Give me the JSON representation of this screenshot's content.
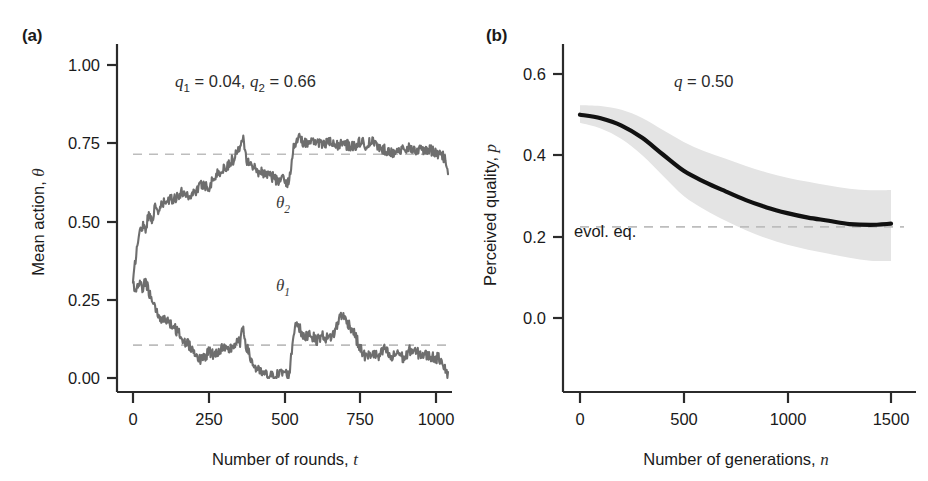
{
  "figure": {
    "background": "#ffffff",
    "panels": [
      "a",
      "b"
    ]
  },
  "panel_a": {
    "label": "(a)",
    "annotation": {
      "q1_sym": "q",
      "q1_sub": "1",
      "q1_eq": " = 0.04, ",
      "q2_sym": "q",
      "q2_sub": "2",
      "q2_eq": " = 0.66",
      "full": "q1 = 0.04, q2 = 0.66"
    },
    "curve_labels": {
      "upper_sym": "θ",
      "upper_sub": "2",
      "lower_sym": "θ",
      "lower_sub": "1"
    },
    "ylabel_text": "Mean action, ",
    "ylabel_sym": "θ",
    "xlabel_text": "Number of rounds, ",
    "xlabel_sym": "t",
    "yticks": [
      "0.00",
      "0.25",
      "0.50",
      "0.75",
      "1.00"
    ],
    "xticks": [
      "0",
      "250",
      "500",
      "750",
      "1000"
    ],
    "line_color": "#6e6e6e",
    "dash_color": "#b9b9b9"
  },
  "panel_b": {
    "label": "(b)",
    "annotation": {
      "q_sym": "q",
      "q_eq": " = 0.50",
      "full": "q = 0.50"
    },
    "evol_label": "evol. eq.",
    "ylabel_text": "Perceived quality, ",
    "ylabel_sym": "p",
    "xlabel_text": "Number of generations, ",
    "xlabel_sym": "n",
    "yticks": [
      "0.0",
      "0.2",
      "0.4",
      "0.6"
    ],
    "xticks": [
      "0",
      "500",
      "1000",
      "1500"
    ],
    "line_color": "#111111",
    "band_color": "#e4e4e4",
    "dash_color": "#b9b9b9"
  },
  "chart_data": [
    {
      "type": "line",
      "panel": "a",
      "title": "",
      "xlabel": "Number of rounds, t",
      "ylabel": "Mean action, θ",
      "xlim": [
        0,
        1000
      ],
      "ylim": [
        0.0,
        1.0
      ],
      "xticks": [
        0,
        250,
        500,
        750,
        1000
      ],
      "yticks": [
        0.0,
        0.25,
        0.5,
        0.75,
        1.0
      ],
      "grid": false,
      "legend": "inline-labels",
      "annotations": [
        {
          "text": "q1 = 0.04, q2 = 0.66",
          "x": 430,
          "y": 0.9
        },
        {
          "text": "θ2",
          "x": 500,
          "y": 0.58
        },
        {
          "text": "θ1",
          "x": 500,
          "y": 0.22
        }
      ],
      "reference_lines": [
        {
          "name": "theta2-equilibrium",
          "y": 0.715,
          "style": "dashed"
        },
        {
          "name": "theta1-equilibrium",
          "y": 0.105,
          "style": "dashed"
        }
      ],
      "series": [
        {
          "name": "theta_2",
          "color": "#6e6e6e",
          "x": [
            0,
            10,
            20,
            30,
            40,
            50,
            60,
            70,
            80,
            90,
            100,
            120,
            140,
            160,
            180,
            200,
            220,
            240,
            260,
            280,
            300,
            320,
            340,
            350,
            360,
            380,
            400,
            420,
            440,
            460,
            480,
            495,
            500,
            510,
            520,
            540,
            560,
            580,
            600,
            620,
            640,
            660,
            680,
            700,
            720,
            740,
            760,
            780,
            800,
            820,
            840,
            860,
            880,
            900,
            920,
            940,
            960,
            980,
            990,
            1000
          ],
          "values": [
            0.3,
            0.4,
            0.46,
            0.49,
            0.48,
            0.52,
            0.51,
            0.54,
            0.53,
            0.55,
            0.56,
            0.57,
            0.58,
            0.595,
            0.58,
            0.6,
            0.62,
            0.61,
            0.645,
            0.66,
            0.68,
            0.7,
            0.745,
            0.78,
            0.7,
            0.675,
            0.66,
            0.655,
            0.645,
            0.63,
            0.635,
            0.62,
            0.665,
            0.735,
            0.77,
            0.755,
            0.745,
            0.76,
            0.745,
            0.755,
            0.74,
            0.75,
            0.745,
            0.74,
            0.755,
            0.745,
            0.755,
            0.735,
            0.73,
            0.72,
            0.73,
            0.725,
            0.735,
            0.73,
            0.725,
            0.73,
            0.72,
            0.715,
            0.7,
            0.64
          ]
        },
        {
          "name": "theta_1",
          "color": "#6e6e6e",
          "x": [
            0,
            10,
            20,
            30,
            40,
            50,
            60,
            70,
            80,
            90,
            100,
            120,
            140,
            160,
            180,
            200,
            220,
            240,
            260,
            280,
            300,
            320,
            340,
            350,
            360,
            380,
            400,
            420,
            440,
            460,
            480,
            495,
            500,
            510,
            520,
            540,
            560,
            580,
            600,
            620,
            640,
            660,
            680,
            700,
            720,
            740,
            760,
            780,
            800,
            820,
            840,
            860,
            880,
            900,
            920,
            940,
            960,
            980,
            990,
            1000
          ],
          "values": [
            0.3,
            0.275,
            0.3,
            0.285,
            0.31,
            0.28,
            0.24,
            0.22,
            0.2,
            0.185,
            0.195,
            0.17,
            0.15,
            0.12,
            0.105,
            0.075,
            0.055,
            0.085,
            0.075,
            0.095,
            0.085,
            0.105,
            0.115,
            0.16,
            0.1,
            0.045,
            0.02,
            0.01,
            0.005,
            0.01,
            0.02,
            0.005,
            0.045,
            0.145,
            0.185,
            0.125,
            0.145,
            0.12,
            0.135,
            0.125,
            0.145,
            0.205,
            0.18,
            0.15,
            0.095,
            0.065,
            0.08,
            0.065,
            0.095,
            0.06,
            0.085,
            0.06,
            0.09,
            0.08,
            0.075,
            0.07,
            0.065,
            0.06,
            0.035,
            0.005
          ]
        }
      ]
    },
    {
      "type": "line",
      "panel": "b",
      "title": "",
      "xlabel": "Number of generations, n",
      "ylabel": "Perceived quality, p",
      "xlim": [
        0,
        1500
      ],
      "ylim": [
        -0.06,
        0.68
      ],
      "xticks": [
        0,
        500,
        1000,
        1500
      ],
      "yticks": [
        0.0,
        0.2,
        0.4,
        0.6
      ],
      "grid": false,
      "annotations": [
        {
          "text": "q = 0.50",
          "x": 700,
          "y": 0.6
        },
        {
          "text": "evol. eq.",
          "x": 180,
          "y": 0.255
        }
      ],
      "reference_lines": [
        {
          "name": "evolutionary-equilibrium",
          "y": 0.224,
          "style": "dashed"
        }
      ],
      "series": [
        {
          "name": "mean-perceived-quality",
          "color": "#111111",
          "x": [
            0,
            100,
            200,
            300,
            400,
            500,
            600,
            700,
            800,
            900,
            1000,
            1100,
            1200,
            1300,
            1400,
            1500
          ],
          "values": [
            0.5,
            0.491,
            0.473,
            0.443,
            0.402,
            0.362,
            0.335,
            0.312,
            0.29,
            0.272,
            0.258,
            0.247,
            0.239,
            0.231,
            0.229,
            0.232
          ]
        },
        {
          "name": "band-upper",
          "color": "#e4e4e4",
          "x": [
            0,
            100,
            200,
            300,
            400,
            500,
            600,
            700,
            800,
            900,
            1000,
            1100,
            1200,
            1300,
            1400,
            1500
          ],
          "values": [
            0.523,
            0.521,
            0.512,
            0.492,
            0.462,
            0.433,
            0.41,
            0.392,
            0.374,
            0.358,
            0.345,
            0.335,
            0.326,
            0.318,
            0.314,
            0.315
          ]
        },
        {
          "name": "band-lower",
          "color": "#e4e4e4",
          "x": [
            0,
            100,
            200,
            300,
            400,
            500,
            600,
            700,
            800,
            900,
            1000,
            1100,
            1200,
            1300,
            1400,
            1500
          ],
          "values": [
            0.48,
            0.466,
            0.44,
            0.4,
            0.35,
            0.3,
            0.267,
            0.24,
            0.216,
            0.196,
            0.18,
            0.168,
            0.158,
            0.148,
            0.141,
            0.14
          ]
        }
      ]
    }
  ]
}
